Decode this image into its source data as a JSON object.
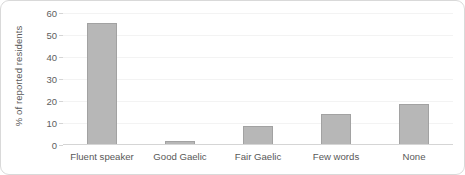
{
  "chart_data": {
    "type": "bar",
    "title": "",
    "subtitle": "",
    "xlabel": "",
    "ylabel": "% of reported residents",
    "categories": [
      "Fluent speaker",
      "Good Gaelic",
      "Fair Gaelic",
      "Few words",
      "None"
    ],
    "values": [
      55.5,
      2.0,
      8.8,
      14.3,
      18.5
    ],
    "ylim": [
      0,
      60
    ],
    "yticks": [
      0,
      10,
      20,
      30,
      40,
      50,
      60
    ],
    "ytick_labels": [
      "0",
      "10",
      "20",
      "30",
      "40",
      "50",
      "60"
    ],
    "grid": "horizontal-faint",
    "legend": "none",
    "series": [
      {
        "name": "% of reported residents",
        "values": [
          55.5,
          2.0,
          8.8,
          14.3,
          18.5
        ]
      }
    ],
    "colors": {
      "bar_fill": "#b7b7b7",
      "bar_stroke": "#a2a2a2",
      "axis": "#d5d5d5",
      "grid": "#f3f3f3",
      "text": "#585858",
      "frame": "#d9d9d9",
      "background": "#ffffff"
    }
  }
}
